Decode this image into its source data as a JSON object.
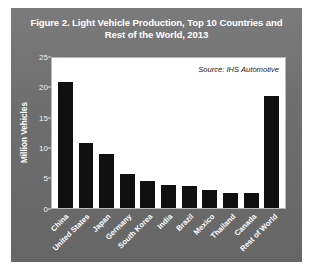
{
  "figure": {
    "title": "Figure 2. Light Vehicle Production, Top 10 Countries and Rest of the World, 2013",
    "source_note": "Source: IHS Automotive",
    "colors": {
      "panel_background": "#6f6f6f",
      "plot_background": "#ffffff",
      "bar_color": "#101010",
      "title_color": "#ffffff",
      "axis_text_color": "#ffffff"
    }
  },
  "chart_data": {
    "type": "bar",
    "title": "Figure 2. Light Vehicle Production, Top 10 Countries and Rest of the World, 2013",
    "xlabel": "",
    "ylabel": "Million Vehicles",
    "categories": [
      "China",
      "United States",
      "Japan",
      "Germany",
      "South Korea",
      "India",
      "Brazil",
      "Mexico",
      "Thailand",
      "Canada",
      "Rest of World"
    ],
    "values": [
      21.0,
      10.8,
      9.0,
      5.6,
      4.4,
      3.8,
      3.6,
      3.0,
      2.5,
      2.4,
      18.6
    ],
    "ylim": [
      0,
      25
    ],
    "yticks": [
      0,
      5,
      10,
      15,
      20,
      25
    ],
    "ytick_labels": [
      "0",
      "5",
      "10",
      "15",
      "20",
      "25"
    ],
    "grid": false,
    "legend": false,
    "annotations": [
      {
        "text": "Source: IHS Automotive",
        "position": "top-right-inside-plot",
        "style": "italic"
      }
    ]
  }
}
